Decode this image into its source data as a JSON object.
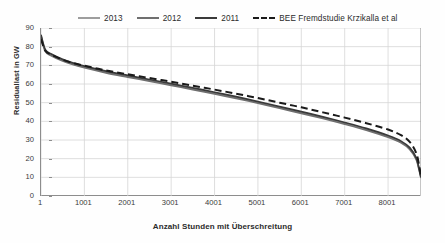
{
  "chart_data": {
    "type": "line",
    "title": "",
    "xlabel": "Anzahl Stunden mit Überschreitung",
    "ylabel": "Residuallast in GW",
    "xlim": [
      1,
      8760
    ],
    "ylim": [
      0,
      90
    ],
    "ytick_values": [
      90,
      80,
      70,
      60,
      50,
      40,
      30,
      20,
      10,
      0
    ],
    "xtick_values": [
      1,
      1001,
      2001,
      3001,
      4001,
      5001,
      6001,
      7001,
      8001
    ],
    "grid": true,
    "legend_position": "top",
    "x": [
      1,
      100,
      250,
      500,
      750,
      1001,
      1500,
      2001,
      2500,
      3001,
      3500,
      4001,
      4500,
      5001,
      5500,
      6001,
      6500,
      7001,
      7500,
      8001,
      8300,
      8500,
      8650,
      8720,
      8760
    ],
    "series": [
      {
        "name": "2013",
        "color": "#9d9d9d",
        "dash": "solid",
        "values": [
          86.0,
          78.0,
          75.5,
          72.8,
          70.8,
          69.2,
          66.5,
          64.2,
          62.0,
          59.8,
          57.5,
          55.2,
          52.8,
          50.2,
          47.5,
          44.8,
          42.0,
          39.0,
          35.8,
          32.0,
          29.0,
          25.5,
          20.0,
          14.0,
          9.8
        ]
      },
      {
        "name": "2012",
        "color": "#6f6f6f",
        "dash": "solid",
        "values": [
          85.5,
          77.5,
          75.0,
          72.3,
          70.3,
          68.7,
          66.0,
          63.7,
          61.5,
          59.3,
          57.0,
          54.7,
          52.3,
          49.7,
          47.0,
          44.3,
          41.5,
          38.5,
          35.3,
          31.5,
          28.5,
          25.0,
          19.6,
          13.6,
          9.6
        ]
      },
      {
        "name": "2011",
        "color": "#3a3a3a",
        "dash": "solid",
        "values": [
          86.4,
          78.4,
          75.9,
          73.2,
          71.2,
          69.6,
          66.9,
          64.6,
          62.4,
          60.2,
          57.9,
          55.6,
          53.2,
          50.6,
          47.9,
          45.2,
          42.4,
          39.4,
          36.2,
          32.4,
          29.4,
          25.9,
          20.4,
          14.3,
          10.1
        ]
      },
      {
        "name": "BEE Fremdstudie Krzikalla et al",
        "color": "#1a1a1a",
        "dash": "dashed",
        "values": [
          84.0,
          77.8,
          75.6,
          73.0,
          71.2,
          69.8,
          67.3,
          65.2,
          63.2,
          61.2,
          59.1,
          57.0,
          54.8,
          52.5,
          50.0,
          47.5,
          44.8,
          42.0,
          39.0,
          35.6,
          32.6,
          29.0,
          23.0,
          16.0,
          10.4
        ]
      }
    ]
  },
  "legend": {
    "items": [
      {
        "label": "2013",
        "color": "#9d9d9d",
        "dash": "solid"
      },
      {
        "label": "2012",
        "color": "#6f6f6f",
        "dash": "solid"
      },
      {
        "label": "2011",
        "color": "#3a3a3a",
        "dash": "solid"
      },
      {
        "label": "BEE Fremdstudie Krzikalla et al",
        "color": "#1a1a1a",
        "dash": "dashed"
      }
    ]
  },
  "axes": {
    "y_title": "Residuallast in GW",
    "x_title": "Anzahl Stunden mit Überschreitung",
    "y_ticks": [
      "90",
      "80",
      "70",
      "60",
      "50",
      "40",
      "30",
      "20",
      "10",
      "0"
    ],
    "x_ticks": [
      "1",
      "1001",
      "2001",
      "3001",
      "4001",
      "5001",
      "6001",
      "7001",
      "8001"
    ]
  },
  "style": {
    "grid_color": "#d6d6d6",
    "axis_color": "#8d8d8d",
    "background": "#ffffff"
  }
}
